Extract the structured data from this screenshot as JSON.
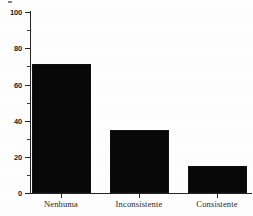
{
  "chart_data": {
    "type": "bar",
    "title": "",
    "subtitle": "",
    "xlabel": "",
    "ylabel": "",
    "categories": [
      "Nenhuma",
      "Inconsistente",
      "Consistente"
    ],
    "values": [
      71,
      35,
      15
    ],
    "series": [
      {
        "name": "",
        "values": [
          71,
          35,
          15
        ]
      }
    ],
    "ylim": [
      0,
      100
    ],
    "y_major_ticks": [
      0,
      20,
      40,
      60,
      80,
      100
    ],
    "y_minor_ticks": [
      10,
      30,
      50,
      70,
      90
    ],
    "y_tick_labels": [
      "0",
      "20",
      "40",
      "60",
      "80",
      "100"
    ],
    "grid": false,
    "legend": false,
    "legend_position": "none",
    "bar_color": "#080808",
    "axis_color": "#262626",
    "background_color": "#fefefe"
  },
  "axis": {
    "y_labels": [
      "100",
      "80",
      "60",
      "40",
      "20",
      "0"
    ],
    "category_labels": [
      "Nenhuma",
      "Inconsistente",
      "Consistente"
    ]
  }
}
